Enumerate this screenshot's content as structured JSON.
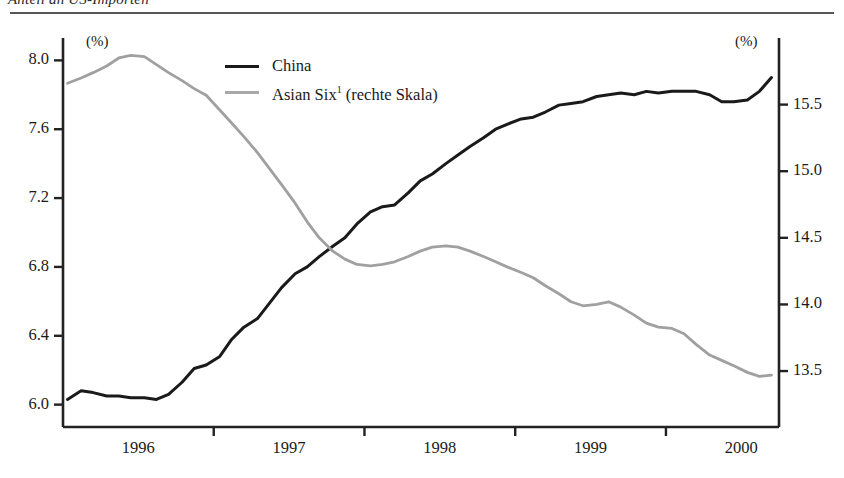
{
  "page": {
    "clipped_heading": "Anteil an US-Importen"
  },
  "chart_data": {
    "type": "line",
    "title": "",
    "xlabel": "",
    "ylabel": "(%)",
    "unit_left": "(%)",
    "unit_right": "(%)",
    "grid": false,
    "legend_position": "top-center",
    "x_tick_labels": [
      "1996",
      "1997",
      "1998",
      "1999",
      "2000"
    ],
    "x_minor_ticks": [
      "1996.5",
      "1997.5",
      "1998.5",
      "1999.5"
    ],
    "xlim": [
      1995.5,
      2000.25
    ],
    "left_axis": {
      "label": "(%)",
      "ticks": [
        "8.0",
        "7.6",
        "7.2",
        "6.8",
        "6.4",
        "6.0"
      ],
      "ylim": [
        5.87,
        8.13
      ]
    },
    "right_axis": {
      "label": "(%)",
      "ticks": [
        "15.5",
        "15.0",
        "14.5",
        "14.0",
        "13.5"
      ],
      "ylim": [
        13.08,
        16.0
      ]
    },
    "series": [
      {
        "name": "China",
        "axis": "left",
        "color": "#1a1a1a",
        "x": [
          1995.53,
          1995.62,
          1995.7,
          1995.79,
          1995.87,
          1995.95,
          1996.04,
          1996.12,
          1996.2,
          1996.29,
          1996.37,
          1996.45,
          1996.54,
          1996.62,
          1996.7,
          1996.79,
          1996.87,
          1996.95,
          1997.04,
          1997.12,
          1997.2,
          1997.29,
          1997.37,
          1997.45,
          1997.54,
          1997.62,
          1997.7,
          1997.79,
          1997.87,
          1997.95,
          1998.04,
          1998.12,
          1998.2,
          1998.29,
          1998.37,
          1998.45,
          1998.54,
          1998.62,
          1998.7,
          1998.79,
          1998.87,
          1998.95,
          1999.04,
          1999.12,
          1999.2,
          1999.29,
          1999.37,
          1999.45,
          1999.54,
          1999.62,
          1999.7,
          1999.79,
          1999.87,
          1999.95,
          2000.04,
          2000.12,
          2000.2
        ],
        "y": [
          6.03,
          6.08,
          6.07,
          6.05,
          6.05,
          6.04,
          6.04,
          6.03,
          6.06,
          6.13,
          6.21,
          6.23,
          6.28,
          6.38,
          6.45,
          6.5,
          6.59,
          6.68,
          6.76,
          6.8,
          6.86,
          6.92,
          6.97,
          7.05,
          7.12,
          7.15,
          7.16,
          7.23,
          7.3,
          7.34,
          7.4,
          7.45,
          7.5,
          7.55,
          7.6,
          7.63,
          7.66,
          7.67,
          7.7,
          7.74,
          7.75,
          7.76,
          7.79,
          7.8,
          7.81,
          7.8,
          7.82,
          7.81,
          7.82,
          7.82,
          7.82,
          7.8,
          7.76,
          7.76,
          7.77,
          7.82,
          7.9
        ]
      },
      {
        "name": "Asian Six¹ (rechte Skala)",
        "axis": "right",
        "color": "#a0a0a0",
        "x": [
          1995.53,
          1995.62,
          1995.7,
          1995.79,
          1995.87,
          1995.95,
          1996.04,
          1996.12,
          1996.2,
          1996.29,
          1996.37,
          1996.45,
          1996.54,
          1996.62,
          1996.7,
          1996.79,
          1996.87,
          1996.95,
          1997.04,
          1997.12,
          1997.2,
          1997.29,
          1997.37,
          1997.45,
          1997.54,
          1997.62,
          1997.7,
          1997.79,
          1997.87,
          1997.95,
          1998.04,
          1998.12,
          1998.2,
          1998.29,
          1998.37,
          1998.45,
          1998.54,
          1998.62,
          1998.7,
          1998.79,
          1998.87,
          1998.95,
          1999.04,
          1999.12,
          1999.2,
          1999.29,
          1999.37,
          1999.45,
          1999.54,
          1999.62,
          1999.7,
          1999.79,
          1999.87,
          1999.95,
          2000.04,
          2000.12,
          2000.2
        ],
        "y": [
          15.66,
          15.7,
          15.74,
          15.79,
          15.85,
          15.87,
          15.86,
          15.8,
          15.74,
          15.68,
          15.62,
          15.57,
          15.46,
          15.36,
          15.26,
          15.14,
          15.02,
          14.9,
          14.76,
          14.62,
          14.5,
          14.4,
          14.34,
          14.3,
          14.29,
          14.3,
          14.32,
          14.36,
          14.4,
          14.43,
          14.44,
          14.43,
          14.4,
          14.36,
          14.32,
          14.28,
          14.24,
          14.2,
          14.14,
          14.08,
          14.02,
          13.99,
          14.0,
          14.02,
          13.98,
          13.92,
          13.86,
          13.83,
          13.82,
          13.78,
          13.7,
          13.62,
          13.58,
          13.54,
          13.49,
          13.46,
          13.47
        ]
      }
    ]
  },
  "legend": {
    "items": [
      {
        "label": "China",
        "color": "#1a1a1a"
      },
      {
        "label": "Asian Six",
        "sup": "1",
        "suffix": " (rechte Skala)",
        "color": "#a0a0a0"
      }
    ]
  }
}
